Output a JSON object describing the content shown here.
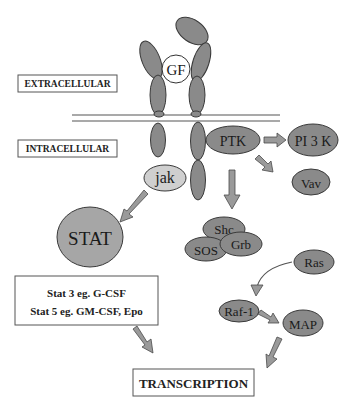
{
  "labels": {
    "extracellular": "EXTRACELLULAR",
    "intracellular": "INTRACELLULAR",
    "transcription": "TRANSCRIPTION"
  },
  "nodes": {
    "gf": "GF",
    "jak": "jak",
    "ptk": "PTK",
    "pi3k": "PI 3 K",
    "vav": "Vav",
    "stat": "STAT",
    "shc": "Shc",
    "sos": "SOS",
    "grb": "Grb",
    "ras": "Ras",
    "raf1": "Raf-1",
    "map": "MAP"
  },
  "stat_box": {
    "line1": "Stat 3 eg. G-CSF",
    "line2": "Stat 5 eg. GM-CSF, Epo"
  },
  "colors": {
    "node_dark": "#8a8a8a",
    "node_light": "#cfcfcf",
    "stat": "#a6a6a6",
    "arrow": "#9a9a9a",
    "outline": "#3a3a3a"
  }
}
